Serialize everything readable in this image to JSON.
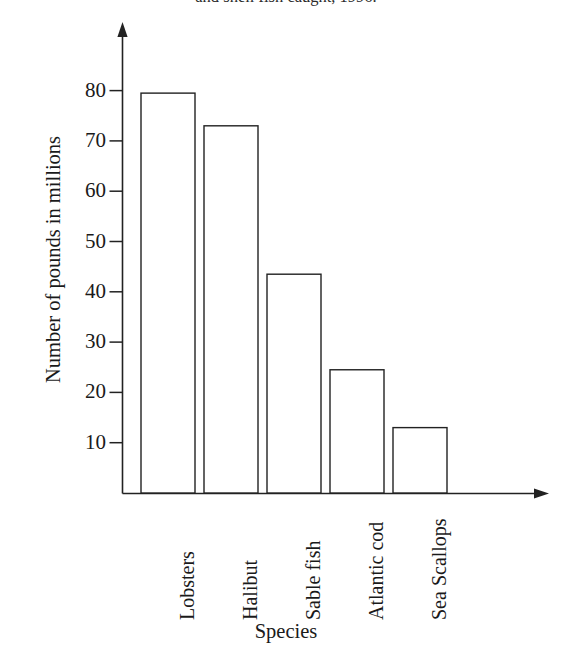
{
  "caption": {
    "text": "and shell fish caught, 1996."
  },
  "chart_data": {
    "type": "bar",
    "title": "",
    "categories": [
      "Lobsters",
      "Halibut",
      "Sable fish",
      "Atlantic cod",
      "Sea Scallops"
    ],
    "values": [
      79.5,
      73,
      43.5,
      24.5,
      13
    ],
    "xlabel": "Species",
    "ylabel": "Number of pounds in millions",
    "ylim": [
      0,
      88
    ],
    "yticks": [
      10,
      20,
      30,
      40,
      50,
      60,
      70,
      80
    ],
    "ytick_labels": [
      "10",
      "20",
      "30",
      "40",
      "50",
      "60",
      "70",
      "80"
    ],
    "grid": false,
    "legend": false,
    "bar_style": {
      "fill": "#ffffff",
      "stroke": "#222222"
    },
    "axis_color": "#222222"
  }
}
